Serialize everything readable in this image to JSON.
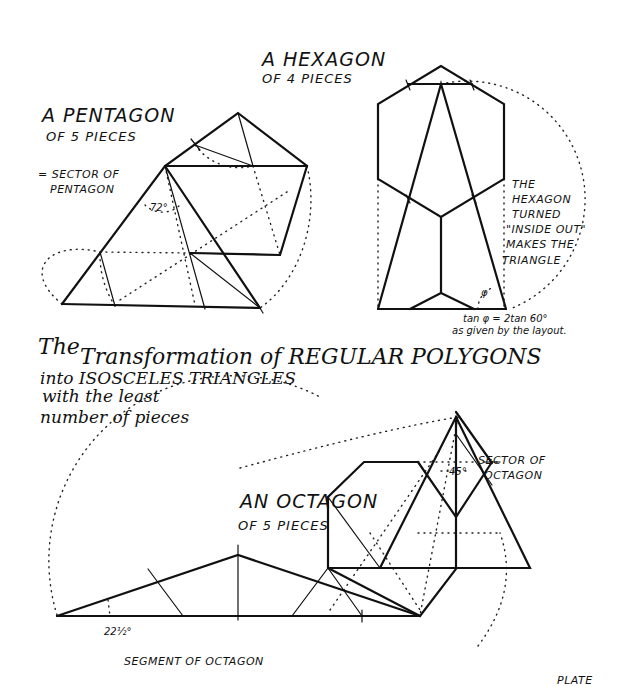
{
  "plate": {
    "label": "PLATE",
    "main_title": {
      "line1a": "The",
      "line1b": "Transformation of REGULAR POLYGONS",
      "line2": "into ISOSCELES TRIANGLES",
      "line3": "with the least",
      "line4": "number of pieces"
    }
  },
  "pentagon": {
    "title": "A PENTAGON",
    "subtitle": "OF 5 PIECES",
    "note_line1": "= SECTOR OF",
    "note_line2": "PENTAGON",
    "angle_label": "72°",
    "outline_points": "62,304 165,166 238,113 307,166 280,255",
    "triangle_points": "62,304 165,166 260,308",
    "cut_lines": [
      [
        165,
        166,
        205,
        309
      ],
      [
        100,
        252,
        115,
        306
      ],
      [
        190,
        253,
        260,
        308
      ],
      [
        190,
        253,
        280,
        255
      ],
      [
        195,
        145,
        253,
        166
      ],
      [
        238,
        113,
        253,
        166
      ],
      [
        62,
        304,
        260,
        308
      ]
    ],
    "dotted_paths": [
      "M 115,306 A 95 95 0 0 1 100,252",
      "M 62,304 C 20,270 50,240 100,252",
      "M 195,145 A 55 55 0 0 0 253,166",
      "M 307,166 C 320,220 300,280 260,308",
      "M 165,166 L 195,305",
      "M 100,252 L 190,253",
      "M 145,205 L 180,205",
      "M 253,166 L 280,255",
      "M 120,300 L 290,190"
    ]
  },
  "hexagon": {
    "title": "A HEXAGON",
    "subtitle": "OF 4 PIECES",
    "note_lines": [
      "THE",
      "HEXAGON",
      "TURNED",
      "\"INSIDE OUT\"",
      "MAKES THE",
      "TRIANGLE"
    ],
    "angle_symbol": "φ",
    "formula": "tan φ = 2tan 60°",
    "formula_note": "as given by the layout.",
    "outline_points": "441,66 378,104 378,179 441,217 504,179 504,104",
    "triangle_points": "378,309 441,84 506,309",
    "cut_lines": [
      [
        408,
        84,
        472,
        84
      ],
      [
        441,
        217,
        441,
        293
      ],
      [
        410,
        309,
        441,
        293
      ],
      [
        441,
        293,
        474,
        309
      ],
      [
        378,
        309,
        506,
        309
      ],
      [
        441,
        66,
        408,
        84
      ],
      [
        441,
        66,
        472,
        84
      ]
    ],
    "dotted_paths": [
      "M 441,84 A 118 118 0 0 1 510,309",
      "M 378,179 L 378,309",
      "M 504,179 L 504,309",
      "M 478,309 A 22 22 0 0 1 492,288"
    ]
  },
  "octagon": {
    "title": "AN OCTAGON",
    "subtitle": "OF 5 PIECES",
    "sector_label_line1": "SECTOR OF",
    "sector_label_line2": "OCTAGON",
    "sector_angle": "45°",
    "segment_label": "SEGMENT OF OCTAGON",
    "segment_angle": "22½°",
    "segment_points": "57,616 238,602 420,619",
    "segment_triangle_points": "57,616 238,555 420,619",
    "octagon_points": "367,533 328,578 328,648 367,693 456,693 456,648",
    "sector_triangle_points": "458,417 381,646 530,646",
    "cut_lines": [
      [
        328,
        578,
        328,
        648
      ],
      [
        328,
        578,
        367,
        533
      ],
      [
        367,
        533,
        418,
        533
      ],
      [
        418,
        533,
        381,
        646
      ],
      [
        328,
        648,
        381,
        646
      ],
      [
        418,
        533,
        458,
        578
      ],
      [
        458,
        578,
        492,
        533
      ],
      [
        458,
        578,
        458,
        646
      ],
      [
        458,
        479,
        492,
        533
      ],
      [
        458,
        417,
        458,
        646
      ],
      [
        381,
        646,
        530,
        646
      ],
      [
        328,
        648,
        420,
        695
      ],
      [
        328,
        578,
        381,
        646
      ],
      [
        417,
        695,
        456,
        648
      ],
      [
        458,
        646,
        420,
        695
      ],
      [
        148,
        649,
        183,
        695
      ],
      [
        238,
        590,
        238,
        700
      ],
      [
        292,
        695,
        328,
        648
      ],
      [
        328,
        648,
        362,
        695
      ],
      [
        57,
        695,
        420,
        695
      ],
      [
        57,
        695,
        238,
        602
      ],
      [
        238,
        602,
        328,
        648
      ]
    ],
    "dotted_paths": [
      "M 57,695 A 185 185 0 0 1 320,477",
      "M 320,477 L 458,417",
      "M 458,417 L 420,695",
      "M 418,533 L 500,533",
      "M 370,533 L 420,640",
      "M 400,560 L 420,695",
      "M 330,640 L 440,480",
      "M 420,695 L 456,648",
      "M 440,470 L 470,470"
    ]
  }
}
